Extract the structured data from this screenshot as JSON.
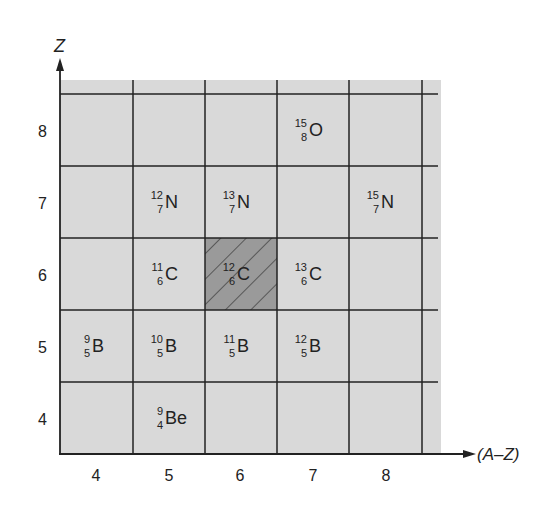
{
  "axes": {
    "y_label": "Z",
    "x_label": "(A–Z)",
    "y_ticks": [
      "8",
      "7",
      "6",
      "5",
      "4"
    ],
    "x_ticks": [
      "4",
      "5",
      "6",
      "7",
      "8"
    ]
  },
  "colors": {
    "background": "#d9d9d9",
    "highlight": "#9a9a9a",
    "grid": "#222222"
  },
  "nuclides": [
    {
      "mass": "15",
      "z": "8",
      "symbol": "O",
      "col": 3,
      "row": 0
    },
    {
      "mass": "12",
      "z": "7",
      "symbol": "N",
      "col": 1,
      "row": 1
    },
    {
      "mass": "13",
      "z": "7",
      "symbol": "N",
      "col": 2,
      "row": 1
    },
    {
      "mass": "15",
      "z": "7",
      "symbol": "N",
      "col": 4,
      "row": 1
    },
    {
      "mass": "11",
      "z": "6",
      "symbol": "C",
      "col": 1,
      "row": 2
    },
    {
      "mass": "12",
      "z": "6",
      "symbol": "C",
      "col": 2,
      "row": 2,
      "highlighted": true
    },
    {
      "mass": "13",
      "z": "6",
      "symbol": "C",
      "col": 3,
      "row": 2
    },
    {
      "mass": "9",
      "z": "5",
      "symbol": "B",
      "col": 0,
      "row": 3
    },
    {
      "mass": "10",
      "z": "5",
      "symbol": "B",
      "col": 1,
      "row": 3
    },
    {
      "mass": "11",
      "z": "5",
      "symbol": "B",
      "col": 2,
      "row": 3
    },
    {
      "mass": "12",
      "z": "5",
      "symbol": "B",
      "col": 3,
      "row": 3
    },
    {
      "mass": "9",
      "z": "4",
      "symbol": "Be",
      "col": 1,
      "row": 4
    }
  ]
}
